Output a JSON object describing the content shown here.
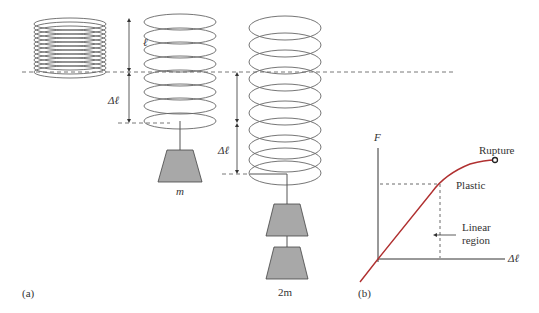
{
  "panel_a": {
    "label": "(a)",
    "length_label": "ℓ",
    "delta_label_1": "Δℓ",
    "delta_label_2": "Δℓ",
    "mass_1_label": "m",
    "mass_2_label": "2m"
  },
  "panel_b": {
    "label": "(b)",
    "y_axis_label": "F",
    "x_axis_label": "Δℓ",
    "rupture_label": "Rupture",
    "plastic_label": "Plastic",
    "linear_label_line1": "Linear",
    "linear_label_line2": "region",
    "curve_color": "#b03030"
  },
  "colors": {
    "line": "#555555",
    "mass_fill": "#a8a8a8"
  }
}
